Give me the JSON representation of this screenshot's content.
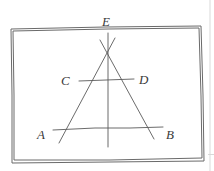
{
  "diagram": {
    "type": "hand-drawn geometric sketch",
    "labels": {
      "E": "E",
      "C": "C",
      "D": "D",
      "A": "A",
      "B": "B"
    },
    "colors": {
      "ink": "#5a5a5a",
      "paper": "#ffffff"
    }
  }
}
